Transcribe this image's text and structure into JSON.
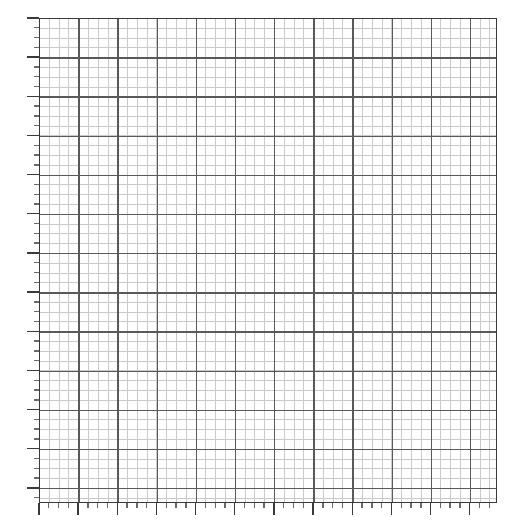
{
  "figure": {
    "kind": "grid-plot",
    "background_color": "#ffffff",
    "width": 530,
    "height": 528,
    "title": "",
    "has_title": false,
    "has_axis_labels": false,
    "has_tick_labels": false,
    "has_legend": false,
    "has_data_series": false
  },
  "plot_area": {
    "left": 39,
    "top": 18,
    "width": 458,
    "height": 485,
    "face_color": "#ffffff",
    "spine_color": "#3a3a3a",
    "spine_width": 1.4
  },
  "grid": {
    "minor_color": "#c9c9c9",
    "major_color": "#595959",
    "minor_width": 1,
    "major_width": 1.4,
    "minor_step_x": 9.79,
    "minor_step_y": 9.79,
    "major_step_x": 39.17,
    "major_step_y": 39.17,
    "minor_columns": 47,
    "minor_rows": 50,
    "major_columns": 12,
    "major_rows": 13,
    "visible": true
  },
  "ticks": {
    "x_major_count": 12,
    "x_minor_count": 47,
    "y_major_count": 13,
    "y_minor_count": 50,
    "major_length": 12,
    "minor_length": 5,
    "major_color": "#3a3a3a",
    "minor_color": "#6a6a6a",
    "direction": "out",
    "x_labels": [],
    "y_labels": []
  },
  "chart_data": {
    "type": "scatter",
    "title": "",
    "subtitle": "",
    "xlabel": "",
    "ylabel": "",
    "x": [],
    "y": [],
    "series": [],
    "categories": [],
    "values": [],
    "xlim": [
      0,
      12
    ],
    "ylim": [
      0,
      13
    ],
    "xticks": [],
    "yticks": [],
    "xticklabels": [],
    "yticklabels": [],
    "grid": true,
    "grid_minor": true,
    "legend": false,
    "legend_position": "none",
    "annotations": [],
    "note": "Empty grid / graph-paper canvas: axes and gridlines drawn with no plotted data, no tick labels, no title and no legend."
  }
}
